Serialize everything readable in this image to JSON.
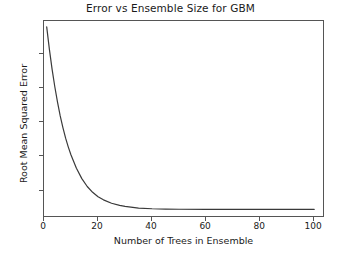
{
  "chart_data": {
    "type": "line",
    "title": "Error vs Ensemble Size for GBM",
    "xlabel": "Number of Trees in Ensemble",
    "ylabel": "Root Mean Squared Error",
    "xlim": [
      0,
      104
    ],
    "ylim": [
      0.2,
      5.95
    ],
    "xticks": [
      0,
      20,
      40,
      60,
      80,
      100
    ],
    "xtick_labels": [
      "0",
      "20",
      "40",
      "60",
      "80",
      "100"
    ],
    "yticks": [
      1,
      2,
      3,
      4,
      5
    ],
    "ytick_labels": [
      "1",
      "2",
      "3",
      "4",
      "5"
    ],
    "grid": false,
    "legend": null,
    "line_color": "#3a3a3a",
    "line_width": 1.2,
    "series": [
      {
        "name": "Root Mean Squared Error",
        "x": [
          1,
          2,
          3,
          4,
          5,
          6,
          7,
          8,
          9,
          10,
          12,
          14,
          16,
          18,
          20,
          22,
          25,
          28,
          30,
          35,
          40,
          45,
          50,
          60,
          70,
          80,
          90,
          100
        ],
        "values": [
          5.78,
          5.12,
          4.54,
          4.03,
          3.58,
          3.18,
          2.84,
          2.53,
          2.27,
          2.04,
          1.65,
          1.35,
          1.12,
          0.95,
          0.82,
          0.73,
          0.63,
          0.57,
          0.54,
          0.49,
          0.47,
          0.46,
          0.455,
          0.45,
          0.45,
          0.45,
          0.45,
          0.45
        ]
      }
    ]
  }
}
